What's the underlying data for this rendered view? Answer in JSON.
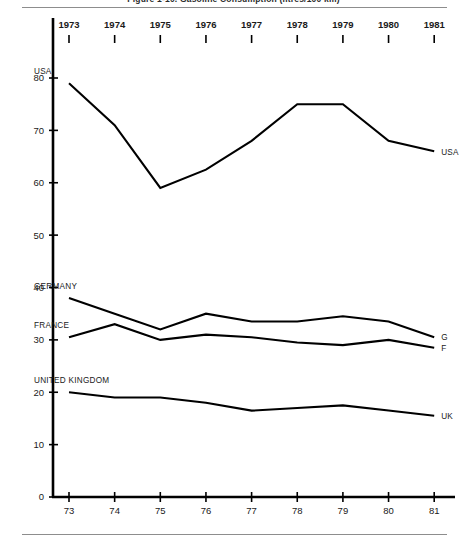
{
  "figure": {
    "title": "Figure 1-10.  Gasoline Consumption (litres/100 km)",
    "top_rule": true,
    "bottom_rule": true
  },
  "chart_data": {
    "type": "line",
    "title": "Figure 1-10.  Gasoline Consumption (litres/100 km)",
    "xlabel": "",
    "ylabel": "",
    "x": [
      1973,
      1974,
      1975,
      1976,
      1977,
      1978,
      1979,
      1980,
      1981
    ],
    "categories": [
      "73",
      "74",
      "75",
      "76",
      "77",
      "78",
      "79",
      "80",
      "81"
    ],
    "top_axis_labels": [
      "1973",
      "1974",
      "1975",
      "1976",
      "1977",
      "1978",
      "1979",
      "1980",
      "1981"
    ],
    "ylim": [
      0,
      84
    ],
    "yticks": [
      0,
      10,
      20,
      30,
      40,
      50,
      60,
      70,
      80
    ],
    "ytick_labels": [
      "0",
      "10",
      "20",
      "30",
      "40",
      "50",
      "60",
      "70",
      "80"
    ],
    "grid": false,
    "legend": "inline-endpoint-labels",
    "series": [
      {
        "name": "USA",
        "label_left": "USA",
        "label_right": "USA",
        "values": [
          79,
          71,
          59,
          62.5,
          68,
          75,
          75,
          68,
          66
        ]
      },
      {
        "name": "GERMANY",
        "label_left": "GERMANY",
        "label_right": "G",
        "values": [
          38,
          35,
          32,
          35,
          33.5,
          33.5,
          34.5,
          33.5,
          30.5
        ]
      },
      {
        "name": "FRANCE",
        "label_left": "FRANCE",
        "label_right": "F",
        "values": [
          30.5,
          33,
          30,
          31,
          30.5,
          29.5,
          29,
          30,
          28.5
        ]
      },
      {
        "name": "UNITED KINGDOM",
        "label_left": "UNITED KINGDOM",
        "label_right": "UK",
        "values": [
          20,
          19,
          19,
          18,
          16.5,
          17,
          17.5,
          16.5,
          15.5
        ]
      }
    ],
    "colors": {
      "line": "#000000",
      "axis": "#000000",
      "text": "#1a1a1a",
      "rule": "#8d8d8d",
      "background": "#ffffff"
    }
  }
}
